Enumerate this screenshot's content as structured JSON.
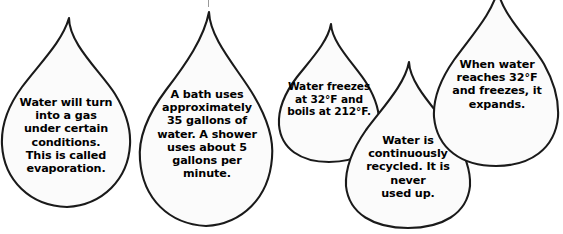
{
  "page": {
    "background_color": "#ffffff",
    "outline_color": "#1a1a1a",
    "fill_color": "#fbfbfb",
    "text_color": "#000000"
  },
  "droplets": [
    {
      "id": "droplet-1",
      "text": "Water will turn\ninto a gas\nunder certain\nconditions.\nThis is called\nevaporation.",
      "lines": [
        "Water will turn",
        "into a gas",
        "under certain",
        "conditions.",
        "This is called",
        "evaporation."
      ]
    },
    {
      "id": "droplet-2",
      "text": "A bath uses\napproximately\n35 gallons of\nwater. A shower\nuses about 5\ngallons per\nminute.",
      "lines": [
        "A bath uses",
        "approximately",
        "35 gallons of",
        "water. A shower",
        "uses about 5",
        "gallons per",
        "minute."
      ]
    },
    {
      "id": "droplet-3",
      "text": "Water freezes\nat 32°F and\nboils at 212°F.",
      "lines": [
        "Water freezes",
        "at 32°F and",
        "boils at 212°F."
      ]
    },
    {
      "id": "droplet-4",
      "text": "Water is\ncontinuously\nrecycled. It is never\nused up.",
      "lines": [
        "Water is",
        "continuously",
        "recycled. It is never",
        "used up."
      ]
    },
    {
      "id": "droplet-5",
      "text": "When water\nreaches 32°F\nand freezes, it\nexpands.",
      "lines": [
        "When water",
        "reaches 32°F",
        "and freezes, it",
        "expands."
      ]
    }
  ]
}
